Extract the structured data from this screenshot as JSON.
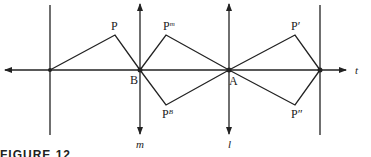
{
  "diagram": {
    "lines": {
      "t": "t",
      "m": "m",
      "l": "l"
    },
    "points": {
      "P": "P",
      "P_m": "P",
      "P_m_sup": "m",
      "P_B": "P",
      "P_B_sup": "B",
      "P_prime": "P′",
      "P_double_prime": "P″",
      "A": "A",
      "B": "B"
    },
    "caption_fragment": "FIGURE 12"
  }
}
